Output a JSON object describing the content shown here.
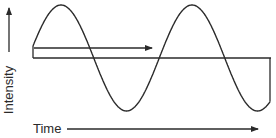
{
  "diagram": {
    "y_axis": {
      "label": "Intensity",
      "direction": "up",
      "arrow": {
        "x": 9,
        "y_start": 52,
        "y_end": 8
      }
    },
    "x_axis": {
      "label": "Time",
      "direction": "right",
      "label_pos": {
        "x": 33,
        "y": 133
      },
      "arrow": {
        "x_start": 67,
        "x_end": 258,
        "y": 129
      }
    },
    "wave": {
      "type": "sine",
      "x_start": 33,
      "x_end": 270,
      "baseline_y": 58,
      "amplitude": 53,
      "period": 131,
      "peaks": [
        {
          "x": 61,
          "y": 5
        },
        {
          "x": 193,
          "y": 5
        }
      ],
      "troughs": [
        {
          "x": 126,
          "y": 111
        },
        {
          "x": 256,
          "y": 111
        }
      ]
    },
    "baseline": {
      "x_start": 33,
      "x_end": 271,
      "y": 58
    },
    "propagation_arrow": {
      "x_start": 34,
      "x_end": 152,
      "y": 48,
      "direction": "right"
    },
    "colors": {
      "stroke": "#2a2a2a",
      "background": "#ffffff"
    }
  }
}
